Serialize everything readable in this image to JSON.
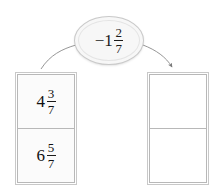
{
  "page": {
    "cutoff_text_fragment": "",
    "background_color": "#ffffff",
    "ink_color": "#1b1b1b"
  },
  "operation_bubble": {
    "name": "operation-oval",
    "sign": "−",
    "whole": "1",
    "numerator": "2",
    "denominator": "7",
    "full_text": "−1 2/7",
    "fill_color": "#f7f7f7",
    "border_color": "#c9c9c9"
  },
  "connectors": {
    "left": {
      "label": "left-connector-line",
      "has_arrowhead": false,
      "target": "input-table"
    },
    "right": {
      "label": "right-connector-arrow",
      "has_arrowhead": true,
      "target": "output-table"
    }
  },
  "input_table": {
    "name": "input-table",
    "fill_color": "#fbfbfb",
    "rows": [
      {
        "whole": "4",
        "numerator": "3",
        "denominator": "7",
        "full_text": "4 3/7"
      },
      {
        "whole": "6",
        "numerator": "5",
        "denominator": "7",
        "full_text": "6 5/7"
      }
    ]
  },
  "output_table": {
    "name": "output-table",
    "fill_color": "#ffffff",
    "rows": [
      {
        "value": "",
        "full_text": ""
      },
      {
        "value": "",
        "full_text": ""
      }
    ]
  }
}
